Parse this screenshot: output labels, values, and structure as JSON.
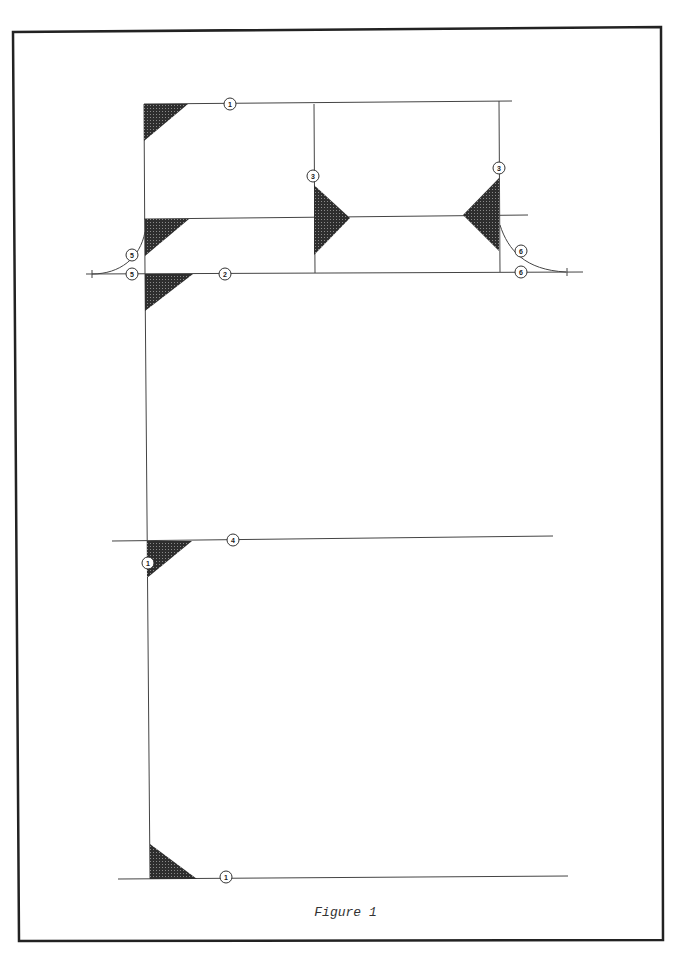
{
  "figure": {
    "caption": "Figure 1",
    "hatch_color": "#3a3a3a",
    "line_color": "#444444",
    "labels": [
      {
        "id": "l1",
        "text": "1",
        "x": 230,
        "y": 104
      },
      {
        "id": "l2",
        "text": "3",
        "x": 313,
        "y": 176
      },
      {
        "id": "l3",
        "text": "3",
        "x": 499,
        "y": 168
      },
      {
        "id": "l4",
        "text": "5",
        "x": 132,
        "y": 255
      },
      {
        "id": "l5",
        "text": "5",
        "x": 132,
        "y": 274
      },
      {
        "id": "l6",
        "text": "2",
        "x": 225,
        "y": 274
      },
      {
        "id": "l7",
        "text": "6",
        "x": 521,
        "y": 251
      },
      {
        "id": "l8",
        "text": "6",
        "x": 521,
        "y": 272
      },
      {
        "id": "l9",
        "text": "4",
        "x": 233,
        "y": 540
      },
      {
        "id": "l10",
        "text": "1",
        "x": 148,
        "y": 563
      },
      {
        "id": "l11",
        "text": "1",
        "x": 226,
        "y": 877
      }
    ]
  }
}
